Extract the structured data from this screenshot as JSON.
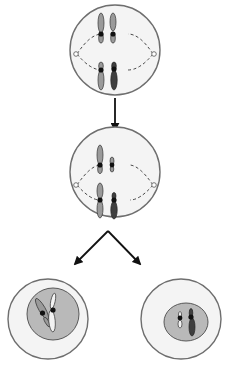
{
  "diagram": {
    "type": "cell-division-flow",
    "colors": {
      "cell_outline": "#6e6e6e",
      "cell_fill": "#f2f2f2",
      "nucleus_fill": "#b9b9b9",
      "nucleus_outline": "#4a4a4a",
      "chromosome_light": "#9a9a9a",
      "chromosome_dark": "#3f3f3f",
      "centromere": "#111111",
      "spindle": "#333333",
      "arrow": "#111111"
    },
    "stages": [
      {
        "id": "stage-1",
        "name": "metaphase-cell-top"
      },
      {
        "id": "stage-2",
        "name": "metaphase-cell-middle"
      },
      {
        "id": "stage-3a",
        "name": "daughter-cell-left"
      },
      {
        "id": "stage-3b",
        "name": "daughter-cell-right"
      }
    ],
    "arrows": [
      {
        "from": "stage-1",
        "to": "stage-2"
      },
      {
        "from": "stage-2",
        "to": "stage-3a"
      },
      {
        "from": "stage-2",
        "to": "stage-3b"
      }
    ]
  }
}
